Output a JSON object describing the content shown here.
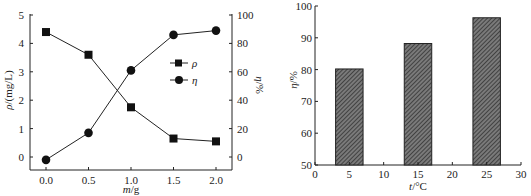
{
  "chart_data": [
    {
      "type": "line",
      "title": "",
      "xlabel": "m/g",
      "ylabel": "ρ/(mg/L)",
      "y2label": "η/%",
      "x": [
        0.0,
        0.5,
        1.0,
        1.5,
        2.0
      ],
      "xticks": [
        "0.0",
        "0.5",
        "1.0",
        "1.5",
        "2.0"
      ],
      "yticks": [
        "0",
        "1",
        "2",
        "3",
        "4",
        "5"
      ],
      "y2ticks": [
        "0",
        "20",
        "40",
        "60",
        "80",
        "100"
      ],
      "xlim": [
        -0.2,
        2.2
      ],
      "ylim": [
        -0.5,
        5
      ],
      "y2lim": [
        -10,
        100
      ],
      "grid": false,
      "legend_position": "center-right",
      "series": [
        {
          "name": "ρ",
          "axis": "left",
          "marker": "square",
          "values": [
            4.4,
            3.6,
            1.75,
            0.65,
            0.55
          ]
        },
        {
          "name": "η",
          "axis": "right",
          "marker": "circle",
          "values": [
            -2,
            17,
            61,
            86,
            89
          ]
        }
      ]
    },
    {
      "type": "bar",
      "title": "",
      "xlabel": "t/°C",
      "ylabel": "η/%",
      "categories": [
        5,
        15,
        25
      ],
      "values": [
        80.2,
        88.2,
        96.3
      ],
      "xticks": [
        "0",
        "5",
        "10",
        "15",
        "20",
        "25",
        "30"
      ],
      "yticks": [
        "50",
        "60",
        "70",
        "80",
        "90",
        "100"
      ],
      "xlim": [
        0,
        30
      ],
      "ylim": [
        50,
        100
      ],
      "bar_width": 4,
      "fill": "hatched",
      "grid": false
    }
  ],
  "labels": {
    "left": {
      "xlabel_italic": "m",
      "xlabel_rest": "/g",
      "ylabel_italic": "ρ",
      "ylabel_rest": "/(mg/L)",
      "y2label_italic": "η",
      "y2label_rest": "/%",
      "legend": [
        "ρ",
        "η"
      ]
    },
    "right": {
      "xlabel_italic": "t",
      "xlabel_rest": "/°C",
      "ylabel_italic": "η",
      "ylabel_rest": "/%"
    }
  }
}
